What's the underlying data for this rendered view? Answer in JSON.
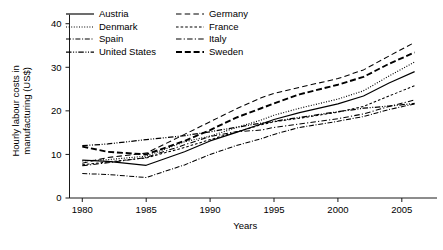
{
  "chart_data": {
    "type": "line",
    "title": "",
    "xlabel": "Years",
    "ylabel": "Hourly labour costs in manufacturing (US$)",
    "ylabel_line1": "Hourly labour costs in",
    "ylabel_line2": "manufacturing (US$)",
    "xlim": [
      1979,
      2006.5
    ],
    "ylim": [
      0,
      42
    ],
    "xticks": [
      1980,
      1985,
      1990,
      1995,
      2000,
      2005
    ],
    "xtick_labels": [
      "1980",
      "1985",
      "1990",
      "1995",
      "2000",
      "2005"
    ],
    "yticks": [
      0,
      10,
      20,
      30,
      40
    ],
    "ytick_labels": [
      "0",
      "10",
      "20",
      "30",
      "40"
    ],
    "grid": false,
    "legend_position": "top-left-inside",
    "legend_columns": 2,
    "x": [
      1980,
      1982,
      1985,
      1988,
      1990,
      1992,
      1994,
      1995,
      1997,
      2000,
      2002,
      2004,
      2006
    ],
    "series": [
      {
        "name": "Austria",
        "line_style": "solid",
        "legend_column": 0,
        "values": [
          8.7,
          8.4,
          7.5,
          10.6,
          13.1,
          15.0,
          17.0,
          18.0,
          19.6,
          21.6,
          23.4,
          26.4,
          29.0
        ]
      },
      {
        "name": "Denmark",
        "line_style": "dotted",
        "legend_column": 0,
        "values": [
          8.5,
          8.8,
          9.6,
          12.9,
          14.2,
          16.1,
          17.9,
          19.0,
          20.6,
          22.7,
          24.6,
          28.0,
          31.2
        ]
      },
      {
        "name": "Spain",
        "line_style": "dash-dot",
        "legend_column": 0,
        "values": [
          5.6,
          5.4,
          4.7,
          7.6,
          10.0,
          12.0,
          13.6,
          14.6,
          16.2,
          17.6,
          18.7,
          20.3,
          21.6
        ]
      },
      {
        "name": "United States",
        "line_style": "dash-dot-dot",
        "legend_column": 0,
        "values": [
          12.0,
          12.4,
          13.4,
          14.3,
          15.2,
          16.2,
          17.2,
          17.6,
          18.5,
          19.8,
          20.6,
          21.1,
          21.7
        ]
      },
      {
        "name": "Germany",
        "line_style": "long-dash",
        "legend_column": 1,
        "values": [
          8.0,
          9.3,
          10.3,
          14.6,
          17.5,
          20.4,
          23.0,
          24.0,
          25.4,
          27.4,
          29.4,
          32.6,
          35.7
        ]
      },
      {
        "name": "France",
        "line_style": "short-dash",
        "legend_column": 1,
        "values": [
          7.6,
          8.3,
          9.2,
          11.6,
          13.4,
          15.1,
          16.8,
          17.5,
          18.3,
          19.7,
          21.0,
          23.4,
          25.8
        ]
      },
      {
        "name": "Italy",
        "line_style": "dash-dot",
        "legend_column": 1,
        "values": [
          7.4,
          8.1,
          9.3,
          12.2,
          14.1,
          15.2,
          15.6,
          16.2,
          17.0,
          18.2,
          19.3,
          21.0,
          22.5
        ]
      },
      {
        "name": "Sweden",
        "line_style": "thick-dash",
        "legend_column": 1,
        "values": [
          11.8,
          10.6,
          10.0,
          13.1,
          15.6,
          18.4,
          20.6,
          21.7,
          23.8,
          26.0,
          27.8,
          30.8,
          33.4
        ]
      }
    ]
  }
}
